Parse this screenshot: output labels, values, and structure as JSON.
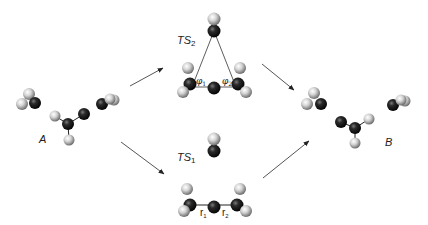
{
  "figure": {
    "labels": {
      "A": "A",
      "B": "B",
      "TS2_main": "TS",
      "TS2_sub": "2",
      "TS1_main": "TS",
      "TS1_sub": "1",
      "phi1_main": "φ",
      "phi1_sub": "1",
      "phi2_main": "φ",
      "phi2_sub": "2",
      "r1_main": "r",
      "r1_sub": "1",
      "r2_main": "r",
      "r2_sub": "2"
    },
    "colors": {
      "carbon": "#1a1a1a",
      "hydrogen": "#d8d8d8",
      "line": "#333333",
      "arrow": "#555555"
    },
    "arrows": [
      {
        "id": "A-to-TS2",
        "x1": 130,
        "y1": 86,
        "x2": 163,
        "y2": 68
      },
      {
        "id": "A-to-TS1",
        "x1": 121,
        "y1": 142,
        "x2": 164,
        "y2": 174
      },
      {
        "id": "TS2-to-B",
        "x1": 262,
        "y1": 64,
        "x2": 294,
        "y2": 90
      },
      {
        "id": "TS1-to-B",
        "x1": 263,
        "y1": 178,
        "x2": 309,
        "y2": 141
      }
    ],
    "atoms": [
      {
        "group": "A-CH2",
        "el": "H",
        "x": 29,
        "y": 94,
        "r": 6
      },
      {
        "group": "A-CH2",
        "el": "C",
        "x": 35,
        "y": 103,
        "r": 6
      },
      {
        "group": "A-CH2",
        "el": "H",
        "x": 22,
        "y": 104,
        "r": 6
      },
      {
        "group": "A-C2H2",
        "el": "H",
        "x": 55,
        "y": 116,
        "r": 5.5
      },
      {
        "group": "A-C2H2",
        "el": "C",
        "x": 68,
        "y": 124,
        "r": 6
      },
      {
        "group": "A-C2H2",
        "el": "C",
        "x": 84,
        "y": 114,
        "r": 6
      },
      {
        "group": "A-C2H2",
        "el": "H",
        "x": 69,
        "y": 140,
        "r": 5.5
      },
      {
        "group": "A-CH",
        "el": "C",
        "x": 102,
        "y": 104,
        "r": 6
      },
      {
        "group": "A-CH",
        "el": "H",
        "x": 114,
        "y": 100,
        "r": 5.5
      },
      {
        "group": "A-CH",
        "el": "H",
        "x": 110,
        "y": 99,
        "r": 5.5
      },
      {
        "group": "TS2-top",
        "el": "C",
        "x": 214,
        "y": 31,
        "r": 6.5
      },
      {
        "group": "TS2-top",
        "el": "H",
        "x": 214,
        "y": 19,
        "r": 6.5
      },
      {
        "group": "TS2-left",
        "el": "H",
        "x": 188,
        "y": 68,
        "r": 6
      },
      {
        "group": "TS2-left",
        "el": "C",
        "x": 190,
        "y": 84,
        "r": 6.5
      },
      {
        "group": "TS2-left",
        "el": "H",
        "x": 183,
        "y": 92,
        "r": 6
      },
      {
        "group": "TS2-center",
        "el": "C",
        "x": 214,
        "y": 88,
        "r": 6.5
      },
      {
        "group": "TS2-right",
        "el": "H",
        "x": 240,
        "y": 68,
        "r": 6
      },
      {
        "group": "TS2-right",
        "el": "C",
        "x": 238,
        "y": 84,
        "r": 6.5
      },
      {
        "group": "TS2-right",
        "el": "H",
        "x": 246,
        "y": 92,
        "r": 6
      },
      {
        "group": "TS1-top",
        "el": "C",
        "x": 214,
        "y": 151,
        "r": 6.5
      },
      {
        "group": "TS1-top",
        "el": "H",
        "x": 214,
        "y": 139,
        "r": 6.5
      },
      {
        "group": "TS1-left",
        "el": "H",
        "x": 187,
        "y": 189,
        "r": 6
      },
      {
        "group": "TS1-left",
        "el": "C",
        "x": 190,
        "y": 205,
        "r": 6.5
      },
      {
        "group": "TS1-left",
        "el": "H",
        "x": 184,
        "y": 211,
        "r": 6
      },
      {
        "group": "TS1-center",
        "el": "C",
        "x": 214,
        "y": 207,
        "r": 6.5
      },
      {
        "group": "TS1-right",
        "el": "H",
        "x": 240,
        "y": 189,
        "r": 6
      },
      {
        "group": "TS1-right",
        "el": "C",
        "x": 237,
        "y": 205,
        "r": 6.5
      },
      {
        "group": "TS1-right",
        "el": "H",
        "x": 246,
        "y": 211,
        "r": 6
      },
      {
        "group": "B-CH2",
        "el": "H",
        "x": 314,
        "y": 93,
        "r": 6
      },
      {
        "group": "B-CH2",
        "el": "C",
        "x": 321,
        "y": 104,
        "r": 6
      },
      {
        "group": "B-CH2",
        "el": "H",
        "x": 307,
        "y": 104,
        "r": 6
      },
      {
        "group": "B-C2H2",
        "el": "C",
        "x": 341,
        "y": 122,
        "r": 6
      },
      {
        "group": "B-C2H2",
        "el": "C",
        "x": 355,
        "y": 128,
        "r": 6
      },
      {
        "group": "B-C2H2",
        "el": "H",
        "x": 369,
        "y": 119,
        "r": 5.5
      },
      {
        "group": "B-C2H2",
        "el": "H",
        "x": 355,
        "y": 143,
        "r": 5.5
      },
      {
        "group": "B-CH",
        "el": "C",
        "x": 393,
        "y": 105,
        "r": 6
      },
      {
        "group": "B-CH",
        "el": "H",
        "x": 405,
        "y": 101,
        "r": 5.5
      },
      {
        "group": "B-CH",
        "el": "H",
        "x": 401,
        "y": 100,
        "r": 5.5
      }
    ],
    "bonds": [
      {
        "x1": 68,
        "y1": 124,
        "x2": 84,
        "y2": 114
      },
      {
        "x1": 68,
        "y1": 124,
        "x2": 55,
        "y2": 116
      },
      {
        "x1": 68,
        "y1": 124,
        "x2": 69,
        "y2": 140
      },
      {
        "x1": 341,
        "y1": 122,
        "x2": 355,
        "y2": 128
      },
      {
        "x1": 355,
        "y1": 128,
        "x2": 369,
        "y2": 119
      },
      {
        "x1": 355,
        "y1": 128,
        "x2": 355,
        "y2": 143
      },
      {
        "x1": 190,
        "y1": 205,
        "x2": 237,
        "y2": 205
      }
    ],
    "triangle": {
      "apex": [
        214,
        31
      ],
      "left": [
        192,
        87
      ],
      "right": [
        236,
        87
      ]
    }
  }
}
